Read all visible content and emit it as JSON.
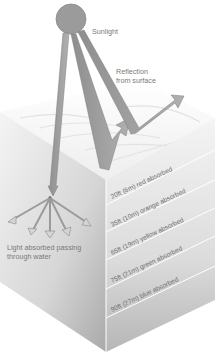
{
  "diagram": {
    "labels": {
      "sunlight": "Sunlight",
      "reflection_line1": "Reflection",
      "reflection_line2": "from surface",
      "absorbed_line1": "Light absorbed passing",
      "absorbed_line2": "through water"
    },
    "depth_layers": [
      {
        "depth_ft": 20,
        "depth_m": 6,
        "color": "red",
        "text": "20ft (6m) red absorbed"
      },
      {
        "depth_ft": 35,
        "depth_m": 10,
        "color": "orange",
        "text": "35ft (10m) orange absorbed"
      },
      {
        "depth_ft": 65,
        "depth_m": 19,
        "color": "yellow",
        "text": "65ft (19m) yellow absorbed"
      },
      {
        "depth_ft": 75,
        "depth_m": 21,
        "color": "green",
        "text": "75ft (21m) green absorbed"
      },
      {
        "depth_ft": 90,
        "depth_m": 27,
        "color": "blue",
        "text": "90ft (27m) blue absorbed"
      }
    ],
    "icons": {
      "sun": "sun-icon",
      "rays": "sunlight-ray-arrow",
      "reflection": "reflection-arrow",
      "scatter": "scatter-arrows"
    },
    "colors": {
      "sun": "#9a9a9a",
      "ray": "#999999",
      "ray_edge": "#7d7d7d",
      "water_top": "#f2f2f2",
      "water_left": "#d8d8d8",
      "water_right": "#c9c9c9",
      "text": "#777777"
    }
  }
}
